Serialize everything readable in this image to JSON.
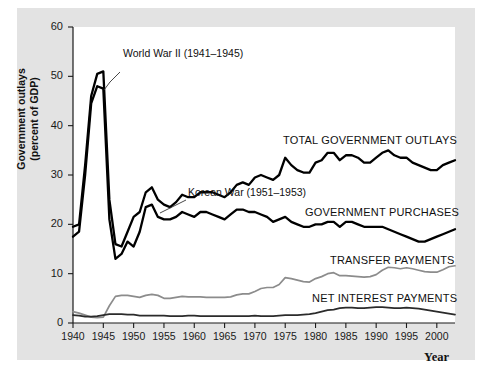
{
  "figure": {
    "background": "#ffffff",
    "panel_color": "#e3e3e3",
    "plot_color": "#ffffff"
  },
  "axis": {
    "ylabel_line1": "Government outlays",
    "ylabel_line2": "(percent of GDP)",
    "xlabel": "Year",
    "yticks": [
      "0",
      "10",
      "20",
      "30",
      "40",
      "50",
      "60"
    ],
    "xticks": [
      "1940",
      "1945",
      "1950",
      "1955",
      "1960",
      "1965",
      "1970",
      "1975",
      "1980",
      "1985",
      "1990",
      "1995",
      "2000"
    ]
  },
  "annotations": [
    {
      "name": "world-war-2",
      "text": "World War II (1941–1945)"
    },
    {
      "name": "korean-war",
      "text": "Korean War (1951–1953)"
    }
  ],
  "series_labels": {
    "total": "TOTAL GOVERNMENT OUTLAYS",
    "purchases": "GOVERNMENT PURCHASES",
    "transfers": "TRANSFER PAYMENTS",
    "interest": "NET INTEREST PAYMENTS"
  },
  "chart_data": {
    "type": "line",
    "title": "",
    "xlabel": "Year",
    "ylabel": "Government outlays (percent of GDP)",
    "xlim": [
      1940,
      2003
    ],
    "ylim": [
      0,
      60
    ],
    "grid": false,
    "legend": "inline-labels",
    "colors": {
      "total_government_outlays": "#000000",
      "government_purchases": "#000000",
      "transfer_payments": "#8c8c8c",
      "net_interest_payments": "#2b2b2b"
    },
    "x": [
      1940,
      1941,
      1942,
      1943,
      1944,
      1945,
      1946,
      1947,
      1948,
      1949,
      1950,
      1951,
      1952,
      1953,
      1954,
      1955,
      1956,
      1957,
      1958,
      1959,
      1960,
      1961,
      1962,
      1963,
      1964,
      1965,
      1966,
      1967,
      1968,
      1969,
      1970,
      1971,
      1972,
      1973,
      1974,
      1975,
      1976,
      1977,
      1978,
      1979,
      1980,
      1981,
      1982,
      1983,
      1984,
      1985,
      1986,
      1987,
      1988,
      1989,
      1990,
      1991,
      1992,
      1993,
      1994,
      1995,
      1996,
      1997,
      1998,
      1999,
      2000,
      2001,
      2002,
      2003
    ],
    "series": [
      {
        "name": "TOTAL GOVERNMENT OUTLAYS",
        "color": "#000000",
        "width": 2.3,
        "values": [
          19.5,
          20.0,
          32.0,
          46.0,
          50.5,
          51.0,
          25.0,
          16.0,
          15.5,
          18.5,
          21.5,
          22.5,
          26.5,
          27.5,
          25.0,
          24.0,
          23.5,
          24.5,
          26.0,
          25.5,
          25.5,
          26.5,
          26.5,
          26.5,
          26.0,
          25.5,
          26.5,
          28.0,
          28.5,
          28.0,
          29.5,
          30.0,
          29.5,
          29.0,
          30.0,
          33.5,
          32.0,
          31.0,
          30.5,
          30.5,
          32.5,
          33.0,
          34.5,
          34.5,
          33.0,
          34.0,
          34.0,
          33.5,
          32.5,
          32.5,
          33.5,
          34.5,
          35.0,
          34.0,
          33.5,
          33.5,
          32.5,
          32.0,
          31.5,
          31.0,
          31.0,
          32.0,
          32.5,
          33.0
        ]
      },
      {
        "name": "GOVERNMENT PURCHASES",
        "color": "#000000",
        "width": 2.3,
        "values": [
          17.5,
          18.5,
          30.0,
          44.5,
          48.0,
          47.5,
          21.0,
          13.0,
          14.0,
          16.5,
          15.5,
          18.5,
          23.5,
          24.0,
          21.5,
          21.0,
          21.0,
          21.5,
          22.5,
          22.0,
          21.5,
          22.5,
          22.5,
          22.0,
          21.5,
          21.0,
          22.0,
          23.0,
          23.0,
          22.5,
          22.5,
          22.0,
          21.5,
          20.5,
          21.0,
          21.5,
          20.5,
          20.0,
          19.5,
          19.5,
          20.0,
          20.0,
          20.5,
          20.5,
          19.5,
          20.5,
          20.5,
          20.0,
          19.5,
          19.5,
          19.5,
          19.5,
          19.0,
          18.5,
          18.0,
          17.5,
          17.0,
          16.5,
          16.5,
          17.0,
          17.5,
          18.0,
          18.5,
          19.0
        ]
      },
      {
        "name": "TRANSFER PAYMENTS",
        "color": "#8c8c8c",
        "width": 1.7,
        "values": [
          2.3,
          2.0,
          1.6,
          1.2,
          1.1,
          1.2,
          3.5,
          5.4,
          5.6,
          5.6,
          5.4,
          5.2,
          5.6,
          5.8,
          5.6,
          5.0,
          5.0,
          5.2,
          5.4,
          5.3,
          5.3,
          5.3,
          5.2,
          5.2,
          5.2,
          5.2,
          5.3,
          5.7,
          5.9,
          5.9,
          6.4,
          7.0,
          7.2,
          7.2,
          7.8,
          9.2,
          9.0,
          8.7,
          8.4,
          8.3,
          9.0,
          9.4,
          10.0,
          10.2,
          9.6,
          9.6,
          9.5,
          9.4,
          9.3,
          9.4,
          9.8,
          10.7,
          11.3,
          11.2,
          11.0,
          11.2,
          11.0,
          10.7,
          10.4,
          10.3,
          10.3,
          10.8,
          11.4,
          11.6
        ]
      },
      {
        "name": "NET INTEREST PAYMENTS",
        "color": "#2b2b2b",
        "width": 1.7,
        "values": [
          1.6,
          1.5,
          1.3,
          1.3,
          1.4,
          1.6,
          1.8,
          1.8,
          1.8,
          1.7,
          1.7,
          1.5,
          1.5,
          1.5,
          1.5,
          1.5,
          1.4,
          1.4,
          1.4,
          1.5,
          1.5,
          1.4,
          1.4,
          1.4,
          1.4,
          1.4,
          1.4,
          1.4,
          1.4,
          1.4,
          1.5,
          1.4,
          1.4,
          1.4,
          1.5,
          1.6,
          1.6,
          1.6,
          1.7,
          1.8,
          2.0,
          2.3,
          2.6,
          2.7,
          3.0,
          3.1,
          3.1,
          3.0,
          3.0,
          3.1,
          3.2,
          3.2,
          3.1,
          3.0,
          3.0,
          3.1,
          3.0,
          2.9,
          2.7,
          2.5,
          2.3,
          2.1,
          1.9,
          1.7
        ]
      }
    ]
  }
}
